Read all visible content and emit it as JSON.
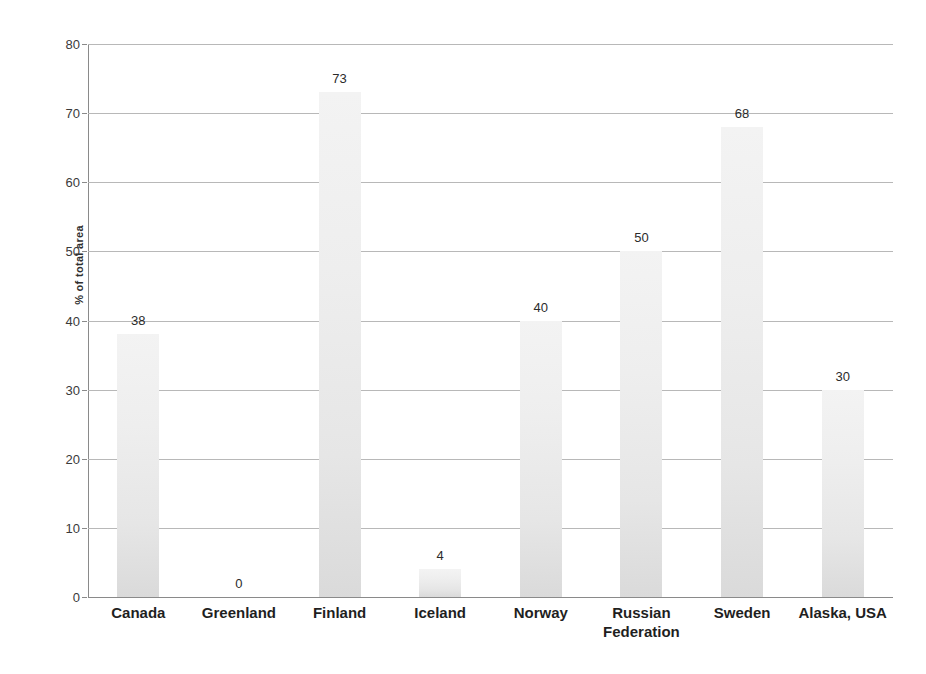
{
  "chart_data": {
    "type": "bar",
    "title": "",
    "subtitle": "",
    "xlabel": "",
    "ylabel": "% of total area",
    "categories": [
      "Canada",
      "Greenland",
      "Finland",
      "Iceland",
      "Norway",
      "Russian Federation",
      "Sweden",
      "Alaska, USA"
    ],
    "values": [
      38,
      0,
      73,
      4,
      40,
      50,
      68,
      30
    ],
    "value_labels": [
      "38",
      "0",
      "73",
      "4",
      "40",
      "50",
      "68",
      "30"
    ],
    "ylim": [
      0,
      80
    ],
    "ytick_labels": [
      "0",
      "10",
      "20",
      "30",
      "40",
      "50",
      "60",
      "70",
      "80"
    ],
    "ytick_values": [
      0,
      10,
      20,
      30,
      40,
      50,
      60,
      70,
      80
    ],
    "grid": "horizontal",
    "legend": "none",
    "bar_color": "#e8e8e8",
    "grid_color": "#b8b8b8",
    "axis_color": "#8a8a8a",
    "text_color": "#2b2b2b",
    "background": "#ffffff"
  },
  "axis": {
    "y_title": "% of total area"
  }
}
